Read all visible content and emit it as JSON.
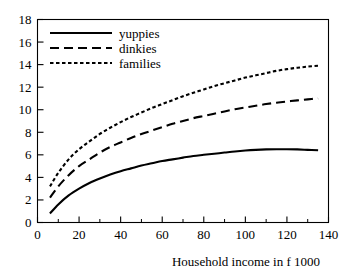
{
  "chart_data": {
    "type": "line",
    "title": "",
    "subtitle": "",
    "xlabel": "Household income in f 1000",
    "ylabel": "",
    "xlim": [
      0,
      140
    ],
    "ylim": [
      0,
      18
    ],
    "xticks": [
      0,
      20,
      40,
      60,
      80,
      100,
      120,
      140
    ],
    "xtick_labels": [
      "0",
      "20",
      "40",
      "60",
      "80",
      "100",
      "120",
      "140"
    ],
    "xminor_ticks": [
      10,
      30,
      50,
      70,
      90,
      110,
      130
    ],
    "yticks": [
      0,
      2,
      4,
      6,
      8,
      10,
      12,
      14,
      16,
      18
    ],
    "ytick_labels": [
      "0",
      "2",
      "4",
      "6",
      "8",
      "10",
      "12",
      "14",
      "16",
      "18"
    ],
    "grid": false,
    "legend_position": "top-left",
    "frame": true,
    "line_color": "#000000",
    "series": [
      {
        "name": "yuppies",
        "dash": "solid",
        "x": [
          6,
          10,
          15,
          20,
          25,
          30,
          35,
          40,
          45,
          50,
          55,
          60,
          65,
          70,
          75,
          80,
          85,
          90,
          95,
          100,
          105,
          110,
          115,
          120,
          125,
          130,
          135
        ],
        "values": [
          0.8,
          1.6,
          2.4,
          3.0,
          3.5,
          3.9,
          4.25,
          4.55,
          4.8,
          5.05,
          5.25,
          5.45,
          5.6,
          5.75,
          5.9,
          6.0,
          6.1,
          6.2,
          6.3,
          6.38,
          6.44,
          6.48,
          6.5,
          6.5,
          6.48,
          6.44,
          6.4
        ]
      },
      {
        "name": "dinkies",
        "dash": "dashed",
        "x": [
          6,
          10,
          15,
          20,
          25,
          30,
          35,
          40,
          45,
          50,
          55,
          60,
          65,
          70,
          75,
          80,
          85,
          90,
          95,
          100,
          105,
          110,
          115,
          120,
          125,
          130,
          135
        ],
        "values": [
          2.2,
          3.2,
          4.2,
          5.0,
          5.6,
          6.2,
          6.7,
          7.1,
          7.5,
          7.85,
          8.15,
          8.45,
          8.75,
          9.0,
          9.25,
          9.45,
          9.65,
          9.85,
          10.05,
          10.2,
          10.35,
          10.5,
          10.62,
          10.73,
          10.83,
          10.92,
          11.0
        ]
      },
      {
        "name": "families",
        "dash": "dotted",
        "x": [
          6,
          10,
          15,
          20,
          25,
          30,
          35,
          40,
          45,
          50,
          55,
          60,
          65,
          70,
          75,
          80,
          85,
          90,
          95,
          100,
          105,
          110,
          115,
          120,
          125,
          130,
          135
        ],
        "values": [
          3.2,
          4.4,
          5.6,
          6.5,
          7.2,
          7.85,
          8.4,
          8.9,
          9.35,
          9.75,
          10.15,
          10.5,
          10.85,
          11.2,
          11.5,
          11.8,
          12.1,
          12.35,
          12.6,
          12.85,
          13.05,
          13.25,
          13.45,
          13.6,
          13.72,
          13.82,
          13.9
        ]
      }
    ]
  },
  "legend": {
    "items": [
      {
        "label": "yuppies"
      },
      {
        "label": "dinkies"
      },
      {
        "label": "families"
      }
    ]
  }
}
